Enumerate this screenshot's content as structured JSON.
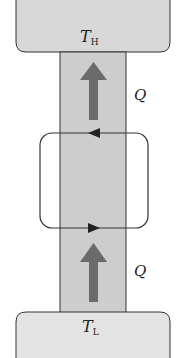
{
  "diagram": {
    "type": "heat-pump-schematic",
    "hot_reservoir": {
      "label": "T",
      "subscript": "H",
      "fill": "#d8d8d8"
    },
    "cold_reservoir": {
      "label": "T",
      "subscript": "L",
      "fill": "#e4e4e4"
    },
    "column": {
      "fill": "#cdcdcd",
      "stroke": "#333333"
    },
    "heat_arrows": [
      {
        "label": "Q",
        "direction": "up",
        "position": "upper"
      },
      {
        "label": "Q",
        "direction": "up",
        "position": "lower"
      }
    ],
    "cycle": {
      "top_arrow_direction": "left",
      "bottom_arrow_direction": "right",
      "stroke": "#333333"
    },
    "arrow_color": "#6b6b6b"
  }
}
